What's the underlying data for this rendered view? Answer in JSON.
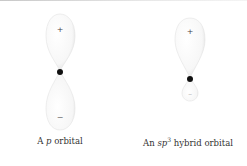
{
  "figures": [
    {
      "id": "p-orbital",
      "caption_prefix": "A ",
      "caption_italic": "p",
      "caption_suffix": " orbital",
      "upper_sign": "+",
      "lower_sign": "−"
    },
    {
      "id": "sp3-orbital",
      "caption_prefix": "An ",
      "caption_italic": "sp",
      "caption_sup": "3",
      "caption_suffix": " hybrid orbital",
      "upper_sign": "+",
      "lower_sign": "−"
    }
  ],
  "colors": {
    "lobe_fill": "#ffffff",
    "lobe_shade": "#dcdcdc",
    "nucleus": "#111111",
    "text": "#333333"
  }
}
